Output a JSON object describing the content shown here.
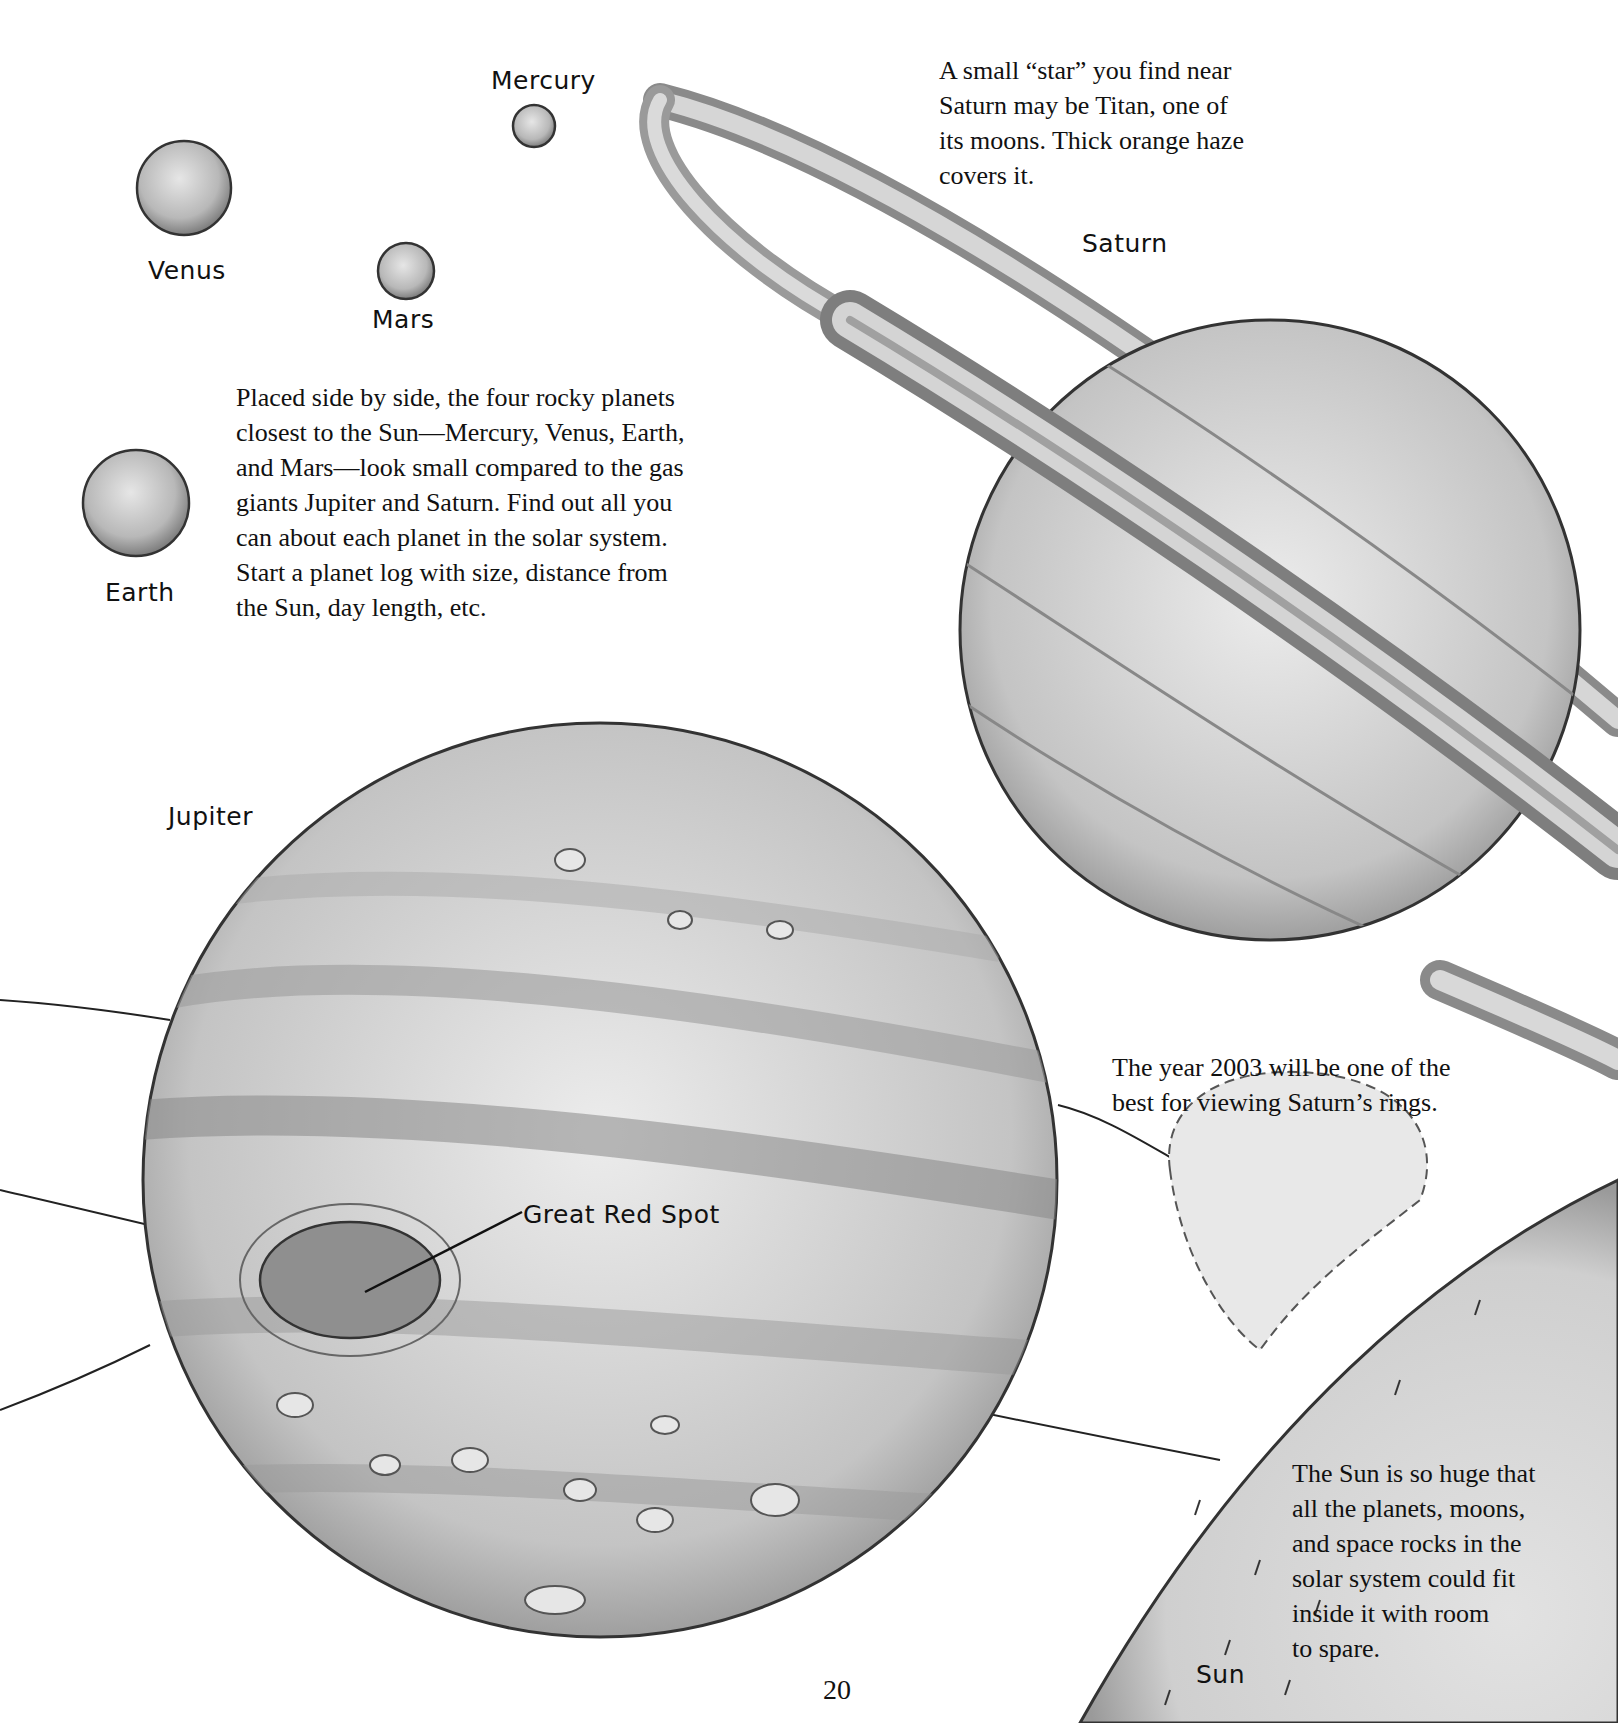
{
  "page_number": "20",
  "labels": {
    "mercury": "Mercury",
    "venus": "Venus",
    "mars": "Mars",
    "earth": "Earth",
    "saturn": "Saturn",
    "jupiter": "Jupiter",
    "great_red_spot": "Great Red Spot",
    "sun": "Sun"
  },
  "captions": {
    "titan": {
      "lines": [
        "A small “star” you find near",
        "Saturn may be Titan, one of",
        "its moons. Thick orange haze",
        "covers it."
      ]
    },
    "rocky_planets": {
      "lines": [
        "Placed side by side, the four rocky planets",
        "closest to the Sun—Mercury, Venus, Earth,",
        "and Mars—look small compared to the gas",
        "giants Jupiter and Saturn. Find out all you",
        "can about each planet in the solar system.",
        "Start a planet log with size, distance from",
        "the Sun, day length, etc."
      ]
    },
    "saturn_rings": {
      "lines": [
        "The year 2003 will be one of the",
        "best for viewing Saturn’s rings."
      ]
    },
    "sun": {
      "lines": [
        "The Sun is so huge that",
        "all the planets, moons,",
        "and space rocks in the",
        "solar system could fit",
        "inside it with room",
        "to spare."
      ]
    }
  },
  "colors": {
    "ink": "#111111",
    "planet_light": "#e4e4e4",
    "planet_mid": "#bdbdbd",
    "planet_dark": "#8a8a8a",
    "sun_fill": "#d9d9d9"
  }
}
